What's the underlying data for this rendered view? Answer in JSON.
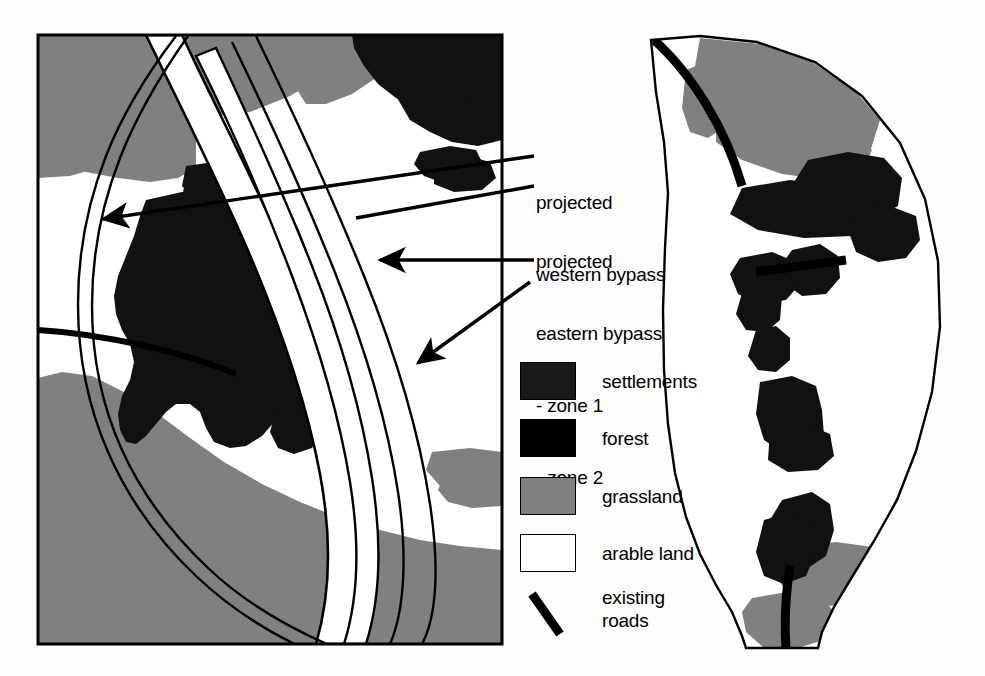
{
  "figure": {
    "kind": "land-use-map-pair",
    "background_color": "#fdfdfd"
  },
  "annotations": [
    {
      "id": "projected-western-bypass",
      "text": "projected\nwestern bypass",
      "arrow_from": [
        536,
        155
      ],
      "arrow_to": [
        96,
        218
      ]
    },
    {
      "id": "projected-eastern-bypass",
      "text": "projected\neastern bypass\n- zone 1\n- zone 2",
      "arrow_from": [
        536,
        260
      ],
      "arrow_to": [
        372,
        260
      ]
    }
  ],
  "annotation_lines": {
    "western_line_1": "projected",
    "western_line_2": "western bypass",
    "eastern_line_1": "projected",
    "eastern_line_2": "eastern bypass",
    "eastern_line_3": "- zone 1",
    "eastern_line_4": "- zone 2"
  },
  "legend": {
    "items": [
      {
        "label": "settlements",
        "symbol": "filled-rect",
        "color": "#1a1a1a",
        "y": 362
      },
      {
        "label": "forest",
        "symbol": "filled-rect",
        "color": "#000000",
        "y": 419
      },
      {
        "label": "grassland",
        "symbol": "filled-rect",
        "color": "#808080",
        "y": 477
      },
      {
        "label": "arable land",
        "symbol": "filled-rect",
        "color": "#ffffff",
        "y": 534
      },
      {
        "label": "existing\nroads",
        "symbol": "thick-diagonal-line",
        "color": "#000000",
        "y": 592
      }
    ]
  },
  "maps": {
    "left": {
      "name": "overview-map",
      "frame": {
        "x": 37,
        "y": 34,
        "width": 466,
        "height": 611
      },
      "frame_stroke": "#000000",
      "base_color": "#ffffff",
      "features": [
        "grassland patches",
        "forest patches",
        "settlement patches",
        "existing roads",
        "projected western bypass (two thin parallel curves)",
        "projected eastern bypass corridor (zone 1 and zone 2 bands)"
      ]
    },
    "right": {
      "name": "corridor-detail-map",
      "shape": "crescent corridor",
      "base_color": "#ffffff",
      "features": [
        "grassland patches",
        "forest patches",
        "settlement patches",
        "existing roads crossing corridor"
      ]
    }
  },
  "colors": {
    "settlements": "#1a1a1a",
    "forest": "#000000",
    "grassland": "#808080",
    "arable_land": "#ffffff",
    "roads": "#000000",
    "outline": "#000000"
  }
}
